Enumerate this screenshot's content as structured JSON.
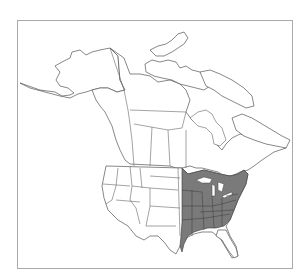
{
  "map": {
    "type": "range-map",
    "region": "North America",
    "frame_border_color": "#a9a9a9",
    "land_fill": "#ffffff",
    "outline_color": "#555555",
    "range_fill": "#7a7a7a",
    "range_description": "Eastern United States and southeastern Canada (shaded)",
    "legend": null,
    "title": null
  }
}
